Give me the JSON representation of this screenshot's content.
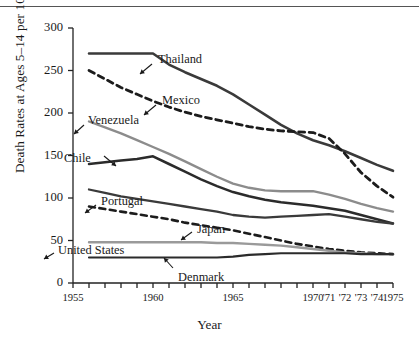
{
  "chart_data": {
    "type": "line",
    "title": "",
    "xlabel": "Year",
    "ylabel": "Death Rates at Ages 5–14 per 100,000",
    "xlim": [
      1955,
      1975
    ],
    "ylim": [
      0,
      300
    ],
    "yticks": [
      0,
      50,
      100,
      150,
      200,
      250,
      300
    ],
    "ytick_labels": [
      "0",
      "50",
      "100",
      "150",
      "200",
      "250",
      "300"
    ],
    "xticks": [
      1955,
      1956,
      1957,
      1958,
      1959,
      1960,
      1961,
      1962,
      1963,
      1964,
      1965,
      1966,
      1967,
      1968,
      1969,
      1970,
      1971,
      1972,
      1973,
      1974,
      1975
    ],
    "xtick_labels": [
      "1955",
      "",
      "",
      "",
      "",
      "1960",
      "",
      "",
      "",
      "",
      "1965",
      "",
      "",
      "",
      "",
      "1970",
      "'71",
      "'72",
      "'73",
      "'74",
      "1975"
    ],
    "grid": false,
    "legend_position": "inline-annotations",
    "x": [
      1956,
      1957,
      1958,
      1959,
      1960,
      1961,
      1962,
      1963,
      1964,
      1965,
      1966,
      1967,
      1968,
      1969,
      1970,
      1971,
      1972,
      1973,
      1974,
      1975
    ],
    "series": [
      {
        "name": "Thailand",
        "style": "solid",
        "color": "#3a3a3a",
        "width": 2.6,
        "values": [
          270,
          270,
          270,
          270,
          270,
          257,
          248,
          240,
          232,
          222,
          210,
          198,
          186,
          176,
          168,
          162,
          155,
          147,
          139,
          132
        ]
      },
      {
        "name": "Mexico",
        "style": "dashed",
        "color": "#1c1c1c",
        "width": 2.8,
        "values": [
          250,
          240,
          230,
          222,
          214,
          207,
          201,
          196,
          192,
          188,
          184,
          181,
          179,
          178,
          177,
          170,
          152,
          130,
          114,
          101
        ]
      },
      {
        "name": "Venezuela",
        "style": "solid",
        "color": "#8c8c8c",
        "width": 2.4,
        "values": [
          190,
          183,
          176,
          168,
          160,
          152,
          143,
          134,
          125,
          117,
          112,
          109,
          108,
          108,
          108,
          104,
          99,
          93,
          88,
          84
        ]
      },
      {
        "name": "Chile",
        "style": "solid",
        "color": "#2b2b2b",
        "width": 2.5,
        "values": [
          140,
          142,
          144,
          146,
          149,
          140,
          131,
          122,
          114,
          107,
          102,
          98,
          95,
          93,
          91,
          88,
          85,
          80,
          75,
          70
        ]
      },
      {
        "name": "Portugal",
        "style": "solid",
        "color": "#3a3a3a",
        "width": 2.3,
        "values": [
          110,
          106,
          102,
          99,
          96,
          93,
          90,
          87,
          84,
          80,
          78,
          77,
          78,
          79,
          80,
          81,
          78,
          75,
          72,
          70
        ]
      },
      {
        "name": "Japan",
        "style": "dashed",
        "color": "#1c1c1c",
        "width": 2.6,
        "values": [
          90,
          87,
          84,
          81,
          78,
          75,
          71,
          68,
          65,
          62,
          58,
          54,
          50,
          46,
          43,
          40,
          38,
          36,
          35,
          34
        ]
      },
      {
        "name": "United States",
        "style": "solid",
        "color": "#9a9a9a",
        "width": 2.4,
        "values": [
          48,
          48,
          48,
          48,
          48,
          48,
          48,
          48,
          47,
          47,
          46,
          45,
          44,
          42,
          40,
          38,
          36,
          35,
          34,
          34
        ]
      },
      {
        "name": "Denmark",
        "style": "solid",
        "color": "#2b2b2b",
        "width": 2.2,
        "values": [
          30,
          30,
          30,
          30,
          30,
          30,
          30,
          30,
          30,
          31,
          33,
          34,
          35,
          35,
          35,
          35,
          35,
          34,
          34,
          34
        ]
      }
    ],
    "annotations": [
      {
        "label": "Thailand",
        "arrow": "up-left"
      },
      {
        "label": "Mexico",
        "arrow": "up-left"
      },
      {
        "label": "Venezuela",
        "arrow": "down-left"
      },
      {
        "label": "Chile",
        "arrow": "down-right"
      },
      {
        "label": "Portugal",
        "arrow": "down-left"
      },
      {
        "label": "Japan",
        "arrow": "down-left"
      },
      {
        "label": "United States",
        "arrow": "down-left"
      },
      {
        "label": "Denmark",
        "arrow": "up-left"
      }
    ]
  }
}
